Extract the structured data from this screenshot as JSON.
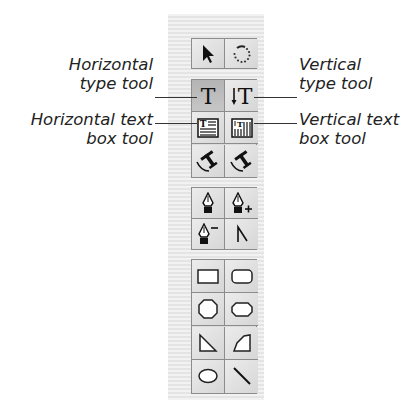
{
  "palette": {
    "groups": [
      {
        "id": "selection",
        "tools": [
          {
            "name": "selection-tool",
            "icon": "arrow-pointer-icon"
          },
          {
            "name": "rotate-tool",
            "icon": "dotted-rotate-icon"
          }
        ]
      },
      {
        "id": "type",
        "tools": [
          {
            "name": "horizontal-type-tool",
            "icon": "horizontal-type-icon",
            "selected": true
          },
          {
            "name": "vertical-type-tool",
            "icon": "vertical-type-icon"
          },
          {
            "name": "horizontal-text-box-tool",
            "icon": "horizontal-text-box-icon"
          },
          {
            "name": "vertical-text-box-tool",
            "icon": "vertical-text-box-icon"
          },
          {
            "name": "horizontal-type-on-path-tool",
            "icon": "type-on-path-icon"
          },
          {
            "name": "vertical-type-on-path-tool",
            "icon": "vertical-type-on-path-icon"
          }
        ]
      },
      {
        "id": "pen",
        "tools": [
          {
            "name": "pen-tool",
            "icon": "pen-nib-icon"
          },
          {
            "name": "add-anchor-point-tool",
            "icon": "pen-plus-icon"
          },
          {
            "name": "delete-anchor-point-tool",
            "icon": "pen-minus-icon"
          },
          {
            "name": "convert-direction-point-tool",
            "icon": "convert-point-icon"
          }
        ]
      },
      {
        "id": "shapes",
        "tools": [
          {
            "name": "rectangle-tool",
            "icon": "rectangle-icon"
          },
          {
            "name": "rounded-rectangle-tool",
            "icon": "rounded-rectangle-icon"
          },
          {
            "name": "octagon-tool",
            "icon": "octagon-icon"
          },
          {
            "name": "beveled-rectangle-tool",
            "icon": "beveled-rectangle-icon"
          },
          {
            "name": "triangle-tool",
            "icon": "triangle-icon"
          },
          {
            "name": "polygon-tool",
            "icon": "polygon-icon"
          },
          {
            "name": "ellipse-tool",
            "icon": "ellipse-icon"
          },
          {
            "name": "line-tool",
            "icon": "line-icon"
          }
        ]
      }
    ]
  },
  "callouts": {
    "horizontal_type": {
      "line1": "Horizontal",
      "line2": "type tool"
    },
    "vertical_type": {
      "line1": "Vertical",
      "line2": "type tool"
    },
    "horizontal_text_box": {
      "line1": "Horizontal text",
      "line2": "box tool"
    },
    "vertical_text_box": {
      "line1": "Vertical text",
      "line2": "box tool"
    }
  }
}
